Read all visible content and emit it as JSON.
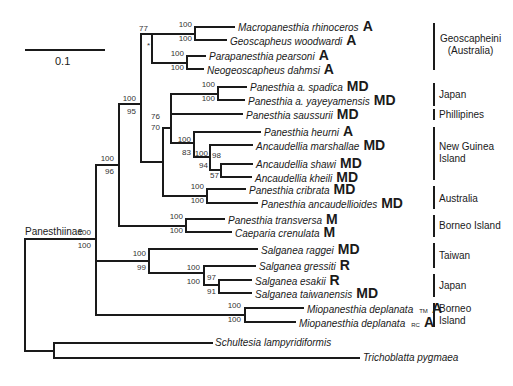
{
  "figure": {
    "scale_bar": {
      "label": "0.1"
    },
    "root_clade_label": "Panesthiinae",
    "star_marker": "*",
    "taxa": [
      {
        "name": "Macropanesthia rhinoceros",
        "state": "A"
      },
      {
        "name": "Geoscapheus woodwardi",
        "state": "A"
      },
      {
        "name": "Parapanesthia pearsoni",
        "state": "A"
      },
      {
        "name": "Neogeoscapheus dahmsi",
        "state": "A"
      },
      {
        "name": "Panesthia a. spadica",
        "state": "MD"
      },
      {
        "name": "Panesthia a. yayeyamensis",
        "state": "MD"
      },
      {
        "name": "Panesthia saussurii",
        "state": "MD"
      },
      {
        "name": "Panesthia heurni",
        "state": "A"
      },
      {
        "name": "Ancaudellia marshallae",
        "state": "MD"
      },
      {
        "name": "Ancaudellia shawi",
        "state": "MD"
      },
      {
        "name": "Ancaudellia kheili",
        "state": "MD"
      },
      {
        "name": "Panesthia cribrata",
        "state": "MD"
      },
      {
        "name": "Panesthia ancaudellioides",
        "state": "MD"
      },
      {
        "name": "Panesthia transversa",
        "state": "M"
      },
      {
        "name": "Caeparia crenulata",
        "state": "M"
      },
      {
        "name": "Salganea raggei",
        "state": "MD"
      },
      {
        "name": "Salganea gressiti",
        "state": "R"
      },
      {
        "name": "Salganea esakii",
        "state": "R"
      },
      {
        "name": "Salganea taiwanensis",
        "state": "MD"
      },
      {
        "name": "Miopanesthia deplanata",
        "suffix": "TM",
        "state": "A"
      },
      {
        "name": "Miopanesthia deplanata",
        "suffix": "RC",
        "state": "A"
      },
      {
        "name": "Schultesia lampyridiformis",
        "state": ""
      },
      {
        "name": "Trichoblatta pygmaea",
        "state": ""
      }
    ],
    "support": {
      "geo_pair": [
        "100",
        "100"
      ],
      "para_pair": [
        "100",
        "100"
      ],
      "geoscapheini": [
        "77",
        ""
      ],
      "geo_plus_panesthia": [
        "100",
        "95"
      ],
      "spadica_pair": [
        "100",
        "100"
      ],
      "panesthia_core": [
        "76",
        "70"
      ],
      "heurni_clade": [
        "100",
        "83"
      ],
      "ancaudellia": [
        "100",
        "94"
      ],
      "shawi_kheili": [
        "98",
        "57"
      ],
      "cribrata_pair": [
        "100",
        "100"
      ],
      "transversa_pair": [
        "100",
        "100"
      ],
      "big_clade": [
        "100",
        "96"
      ],
      "panesthiinae": [
        "100",
        "100"
      ],
      "salganea": [
        "100",
        "99"
      ],
      "gressiti_clade": [
        "100",
        "100"
      ],
      "esakii_pair": [
        "97",
        "91"
      ],
      "miopanesthia_pair": [
        "100",
        "100"
      ]
    },
    "regions": [
      {
        "label": "Geoscapheini\n(Australia)"
      },
      {
        "label": "Japan"
      },
      {
        "label": "Phillipines"
      },
      {
        "label": "New Guinea\nIsland"
      },
      {
        "label": "Australia"
      },
      {
        "label": "Borneo Island"
      },
      {
        "label": "Taiwan"
      },
      {
        "label": "Japan"
      },
      {
        "label": "Borneo\nIsland"
      }
    ]
  }
}
